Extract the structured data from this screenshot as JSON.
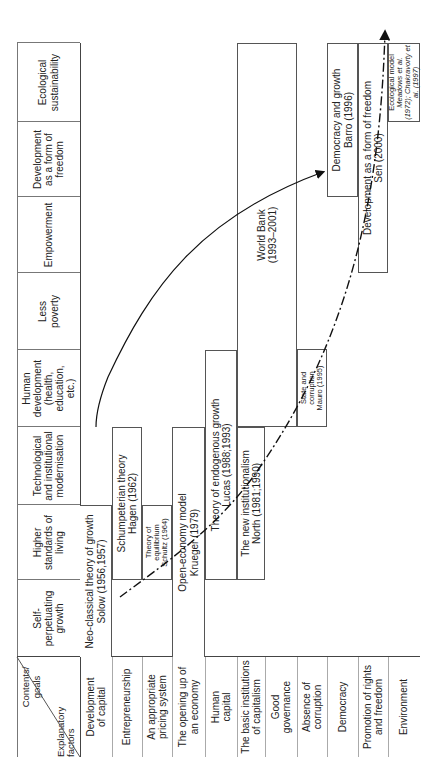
{
  "corner": {
    "top_label": "Contents/ goals",
    "bottom_label": "Explanatory factors"
  },
  "columns": [
    {
      "label": "Self-perpetuating growth"
    },
    {
      "label": "Higher standards of living"
    },
    {
      "label": "Technological and institutional modernisation"
    },
    {
      "label": "Human development (health, education, etc.)"
    },
    {
      "label": "Less poverty"
    },
    {
      "label": "Empowerment"
    },
    {
      "label": "Development as a form of freedom"
    },
    {
      "label": "Ecological sustainability"
    }
  ],
  "rows": [
    {
      "label": "Development of capital"
    },
    {
      "label": "Entrepreneurship"
    },
    {
      "label": "An appropriate pricing system"
    },
    {
      "label": "The opening up of an economy"
    },
    {
      "label": "Human capital"
    },
    {
      "label": "The basic institutions of capitalism"
    },
    {
      "label": "Good governance"
    },
    {
      "label": "Absence of corruption"
    },
    {
      "label": "Democracy"
    },
    {
      "label": "Promotion of rights and freedom"
    },
    {
      "label": "Environment"
    }
  ],
  "theories": [
    {
      "title": "Neo-classical theory of growth",
      "source": "Solow (1956,1957)"
    },
    {
      "title": "Schumpeterian theory",
      "source": "Hagen (1962)"
    },
    {
      "title": "Theory of equilibrium",
      "source": "Schultz (1964)"
    },
    {
      "title": "Open-economy model",
      "source": "Krueger (1979)"
    },
    {
      "title": "Theory of endogenous growth",
      "source": "Lucas (1988;1993)"
    },
    {
      "title": "The new institutionalism",
      "source": "North (1981;1990)"
    },
    {
      "title": "World Bank",
      "source": "(1993–2001)"
    },
    {
      "title": "State and corruption",
      "source": "Mauro (1995)"
    },
    {
      "title": "Democracy and growth",
      "source": "Barro (1996)"
    },
    {
      "title": "Development as a form of freedom",
      "source": "Sen (2000)"
    },
    {
      "title": "Ecological model",
      "source": "Meadows et al. (1972); Chakravorty et al. (1997)"
    }
  ],
  "arrows": [
    {
      "name": "solid-arrow",
      "style": "solid"
    },
    {
      "name": "dash-dot-arrow",
      "style": "dash-dot"
    }
  ]
}
